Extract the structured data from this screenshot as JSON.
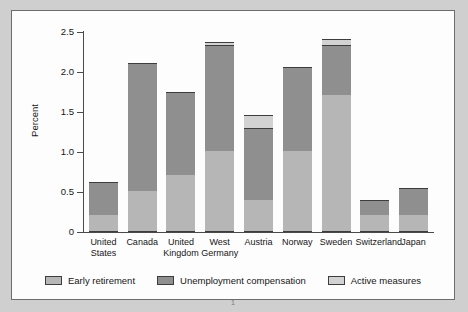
{
  "figure": {
    "axis_title": "Percent",
    "footnote": "1"
  },
  "colors": {
    "early_retirement": "#b6b6b6",
    "unemployment_compensation": "#8f8f8f",
    "active_measures": "#d2d2d2",
    "outline": "#3d3d3d",
    "page_background": "#cfcfcf",
    "panel_background": "#fdfdfd"
  },
  "legend": {
    "items": [
      {
        "label": "Early retirement",
        "key": "early_retirement"
      },
      {
        "label": "Unemployment compensation",
        "key": "unemployment_compensation"
      },
      {
        "label": "Active measures",
        "key": "active_measures"
      }
    ]
  },
  "chart_data": {
    "type": "bar",
    "subtype": "stacked",
    "title": "",
    "xlabel": "",
    "ylabel": "Percent",
    "ylim": [
      0,
      2.5
    ],
    "yticks": [
      0,
      0.5,
      1.0,
      1.5,
      2.0,
      2.5
    ],
    "ytick_labels": [
      "0",
      "0.5",
      "1.0",
      "1.5",
      "2.0",
      "2.5"
    ],
    "grid": false,
    "legend_position": "bottom",
    "categories": [
      "United\nStates",
      "Canada",
      "United\nKingdom",
      "West\nGermany",
      "Austria",
      "Norway",
      "Sweden",
      "Switzerland",
      "Japan"
    ],
    "series": [
      {
        "name": "Early retirement",
        "values": [
          0.2,
          0.5,
          0.7,
          1.0,
          0.39,
          1.0,
          1.7,
          0.2,
          0.2
        ]
      },
      {
        "name": "Unemployment compensation",
        "values": [
          0.41,
          1.6,
          1.04,
          1.32,
          0.9,
          1.05,
          0.62,
          0.19,
          0.34
        ]
      },
      {
        "name": "Active measures",
        "values": [
          0.0,
          0.0,
          0.0,
          0.04,
          0.16,
          0.0,
          0.08,
          0.0,
          0.0
        ]
      }
    ],
    "totals": [
      0.61,
      2.1,
      1.74,
      2.36,
      1.45,
      2.05,
      2.4,
      0.39,
      0.54
    ]
  }
}
